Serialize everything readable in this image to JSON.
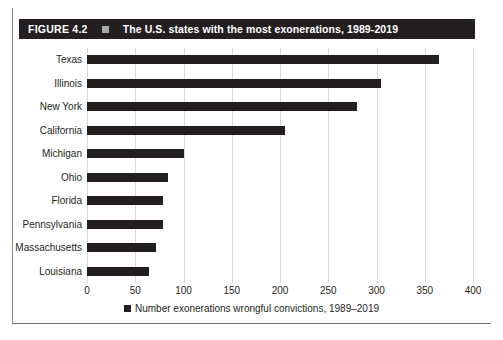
{
  "figure": {
    "number_label": "FIGURE 4.2",
    "marker_icon": "square-marker",
    "title": "The U.S. states with the most exonerations, 1989-2019",
    "bar_color": "#231f20",
    "title_bar_color": "#231f20",
    "title_marker_color": "#a7a9ac",
    "gridline_color": "#d9d9d9"
  },
  "legend": {
    "swatch_icon": "square-swatch",
    "label": "Number exonerations wrongful convictions, 1989–2019"
  },
  "chart_data": {
    "type": "bar",
    "orientation": "horizontal",
    "title": "The U.S. states with the most exonerations, 1989-2019",
    "xlabel": "",
    "ylabel": "",
    "categories": [
      "Texas",
      "Illinois",
      "New York",
      "California",
      "Michigan",
      "Ohio",
      "Florida",
      "Pennsylvania",
      "Massachusetts",
      "Louisiana"
    ],
    "values": [
      365,
      305,
      280,
      205,
      100,
      84,
      79,
      79,
      72,
      64
    ],
    "series": [
      {
        "name": "Number exonerations wrongful convictions, 1989–2019",
        "values": [
          365,
          305,
          280,
          205,
          100,
          84,
          79,
          79,
          72,
          64
        ]
      }
    ],
    "xlim": [
      0,
      400
    ],
    "xticks": [
      0,
      50,
      100,
      150,
      200,
      250,
      300,
      350,
      400
    ],
    "xtick_labels": [
      "0",
      "50",
      "100",
      "150",
      "200",
      "250",
      "300",
      "350",
      "400"
    ],
    "grid": true,
    "grid_axis": "x",
    "legend_position": "bottom"
  }
}
